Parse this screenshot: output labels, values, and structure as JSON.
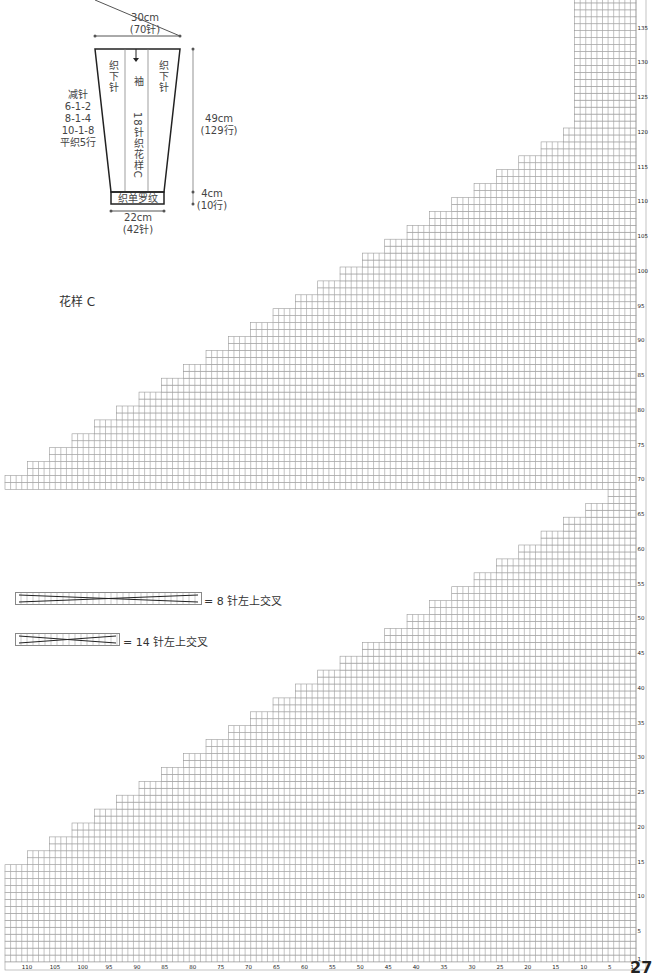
{
  "schematic": {
    "top_width": "30cm",
    "top_stitches": "(70针)",
    "bottom_width": "22cm",
    "bottom_stitches": "(42针)",
    "height_main": "49cm",
    "height_main_rows": "(129行)",
    "height_rib": "4cm",
    "height_rib_rows": "(10行)",
    "left_col_label": "织下针",
    "right_col_label": "织下针",
    "center_label": "袖",
    "center_pattern_label": "18针织花样C",
    "rib_label": "织单罗纹",
    "decrease_title": "减针",
    "decrease_lines": [
      "6-1-2",
      "8-1-4",
      "10-1-8",
      "平织5行"
    ]
  },
  "pattern_title": "花样 C",
  "legend": [
    {
      "symbol": "cable-8",
      "label": "= 8 针左上交叉"
    },
    {
      "symbol": "cable-14",
      "label": "= 14 针左上交叉"
    }
  ],
  "page_number": "27",
  "chart_data": {
    "type": "knitting-chart",
    "title": "花样 C",
    "columns": 113,
    "rows": 139,
    "column_labels": [
      "110",
      "105",
      "100",
      "95",
      "90",
      "85",
      "80",
      "75",
      "70",
      "65",
      "60",
      "55",
      "50",
      "45",
      "40",
      "35",
      "30",
      "25",
      "20",
      "15",
      "10",
      "5",
      "1"
    ],
    "row_labels": [
      "1",
      "5",
      "10",
      "15",
      "20",
      "25",
      "30",
      "35",
      "40",
      "45",
      "50",
      "55",
      "60",
      "65",
      "70",
      "75",
      "80",
      "85",
      "90",
      "95",
      "100",
      "105",
      "110",
      "115",
      "120",
      "125",
      "130",
      "135"
    ],
    "upper_block": {
      "row_range": [
        69,
        139
      ],
      "shape": "staircase widening downward from right"
    },
    "lower_block": {
      "row_range": [
        1,
        68
      ],
      "shape": "staircase widening downward from right"
    },
    "grid_color": "#9a9a9a"
  }
}
